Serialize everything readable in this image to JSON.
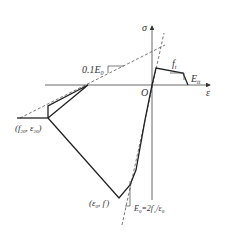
{
  "diagram": {
    "type": "stress-strain constitutive model",
    "axes": {
      "y_label": "σ",
      "x_label": "ε",
      "origin_label": "O"
    },
    "labels": {
      "tensile_strength": "f",
      "tensile_strength_sub": "t",
      "softening_modulus": "E",
      "softening_modulus_sub": "tt",
      "tenth_modulus": "0.1E",
      "tenth_modulus_sub": "0",
      "residual_point": "(f",
      "residual_point_sub1": "20",
      "residual_point_mid": ", ε",
      "residual_point_sub2": "20",
      "residual_point_end": ")",
      "peak_point": "(ε",
      "peak_point_sub": "0",
      "peak_point_mid": ", f",
      "peak_point_sup": "'",
      "peak_point_end": ")",
      "initial_modulus": "E",
      "initial_modulus_sub": "0",
      "initial_modulus_eq": "=2f",
      "initial_modulus_sup": "'",
      "initial_modulus_sub2": "c",
      "initial_modulus_div": "/ε",
      "initial_modulus_sub3": "0"
    },
    "colors": {
      "line": "#222222",
      "axis": "#444444",
      "dashed": "#555555"
    }
  }
}
